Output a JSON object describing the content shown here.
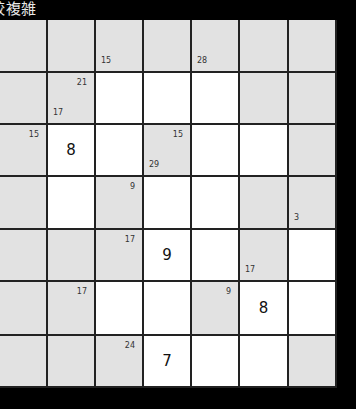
{
  "title": "較複雑",
  "grid": {
    "rows": 7,
    "cols": 7,
    "colors": {
      "grey": "#e2e2e2",
      "white": "#ffffff",
      "line": "#222222",
      "background": "#000000"
    },
    "cells": [
      [
        {
          "t": "grey"
        },
        {
          "t": "grey"
        },
        {
          "t": "grey",
          "down": "15"
        },
        {
          "t": "grey"
        },
        {
          "t": "grey",
          "down": "28"
        },
        {
          "t": "grey"
        },
        {
          "t": "grey"
        }
      ],
      [
        {
          "t": "grey"
        },
        {
          "t": "grey",
          "across": "21",
          "down": "17"
        },
        {
          "t": "white"
        },
        {
          "t": "white"
        },
        {
          "t": "white"
        },
        {
          "t": "grey"
        },
        {
          "t": "grey"
        }
      ],
      [
        {
          "t": "grey",
          "across": "15"
        },
        {
          "t": "white",
          "value": "8"
        },
        {
          "t": "white"
        },
        {
          "t": "grey",
          "across": "15",
          "down": "29"
        },
        {
          "t": "white"
        },
        {
          "t": "white"
        },
        {
          "t": "grey"
        }
      ],
      [
        {
          "t": "grey"
        },
        {
          "t": "white"
        },
        {
          "t": "grey",
          "across": "9"
        },
        {
          "t": "white"
        },
        {
          "t": "white"
        },
        {
          "t": "grey"
        },
        {
          "t": "grey",
          "down": "3"
        }
      ],
      [
        {
          "t": "grey"
        },
        {
          "t": "grey"
        },
        {
          "t": "grey",
          "across": "17"
        },
        {
          "t": "white",
          "value": "9"
        },
        {
          "t": "white"
        },
        {
          "t": "grey",
          "down": "17"
        },
        {
          "t": "white"
        }
      ],
      [
        {
          "t": "grey"
        },
        {
          "t": "grey",
          "across": "17"
        },
        {
          "t": "white"
        },
        {
          "t": "white"
        },
        {
          "t": "grey",
          "across": "9"
        },
        {
          "t": "white",
          "value": "8"
        },
        {
          "t": "white"
        }
      ],
      [
        {
          "t": "grey"
        },
        {
          "t": "grey"
        },
        {
          "t": "grey",
          "across": "24"
        },
        {
          "t": "white",
          "value": "7"
        },
        {
          "t": "white"
        },
        {
          "t": "white"
        },
        {
          "t": "grey"
        }
      ]
    ]
  }
}
